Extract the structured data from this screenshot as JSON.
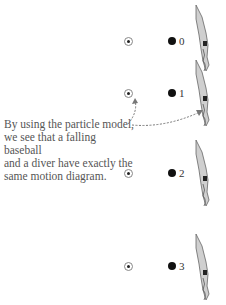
{
  "caption": {
    "lines": [
      "By using the particle model,",
      "we see that a falling baseball",
      "and a diver have exactly the",
      "same motion diagram."
    ]
  },
  "frames": [
    {
      "label": "0",
      "ball_y": 41,
      "dot_y": 41,
      "diver_y": 5
    },
    {
      "label": "1",
      "ball_y": 93,
      "dot_y": 93,
      "diver_y": 60
    },
    {
      "label": "2",
      "ball_y": 173,
      "dot_y": 173,
      "diver_y": 140
    },
    {
      "label": "3",
      "ball_y": 266,
      "dot_y": 266,
      "diver_y": 234
    }
  ],
  "icons": {
    "ball": "baseball-icon",
    "particle": "particle-dot-icon",
    "figure": "diver-figure-icon"
  },
  "colors": {
    "arrow": "#777777",
    "dot": "#111111",
    "text": "#555555"
  }
}
